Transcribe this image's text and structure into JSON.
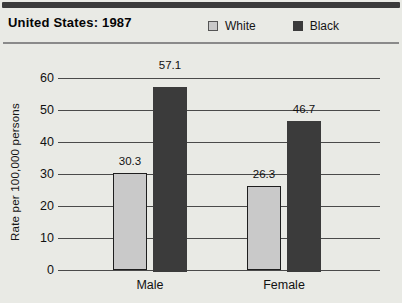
{
  "header": {
    "title": "United States: 1987"
  },
  "chart_data": {
    "type": "bar",
    "title": "United States: 1987",
    "categories": [
      "Male",
      "Female"
    ],
    "series": [
      {
        "name": "White",
        "values": [
          30.3,
          26.3
        ],
        "color": "#c9c9c9",
        "outlined": true
      },
      {
        "name": "Black",
        "values": [
          57.1,
          46.7
        ],
        "color": "#3b3b3b",
        "outlined": false
      }
    ],
    "value_labels": [
      [
        "30.3",
        "26.3"
      ],
      [
        "57.1",
        "46.7"
      ]
    ],
    "xlabel": "",
    "ylabel": "Rate per 100,000 persons",
    "ylim": [
      0,
      60
    ],
    "yticks": [
      0,
      10,
      20,
      30,
      40,
      50,
      60
    ],
    "grid": true,
    "legend_position": "top-right"
  },
  "colors": {
    "background": "#e9eae5",
    "gridline": "#4a4a4a",
    "bar_outline": "#1e1e1e",
    "top_rule": "#3a3a3a",
    "separator": "#8a8a8a",
    "text": "#111111"
  }
}
